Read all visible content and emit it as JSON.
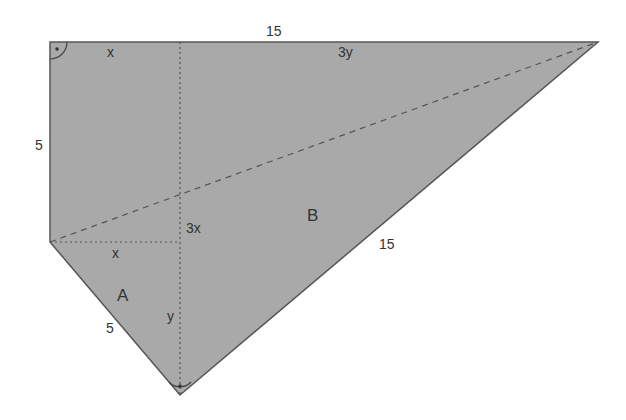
{
  "colors": {
    "fill": "#a9a9a9",
    "stroke": "#555555",
    "text": "#333333",
    "background": "#ffffff"
  },
  "vertices": {
    "top_left": [
      50,
      42
    ],
    "top_right": [
      598,
      42
    ],
    "left_mid": [
      50,
      242
    ],
    "bottom": [
      180,
      395
    ],
    "foot_top": [
      180,
      42
    ]
  },
  "labels": {
    "top_side": "15",
    "top_x": "x",
    "top_3y": "3y",
    "left_side": "5",
    "inner_3x": "3x",
    "inner_x": "x",
    "region_a": "A",
    "region_b": "B",
    "hypotenuse": "15",
    "lower_left_side": "5",
    "segment_y": "y"
  },
  "markers": {
    "right_angle_top_left": "right-angle",
    "right_angle_bottom": "right-angle"
  }
}
